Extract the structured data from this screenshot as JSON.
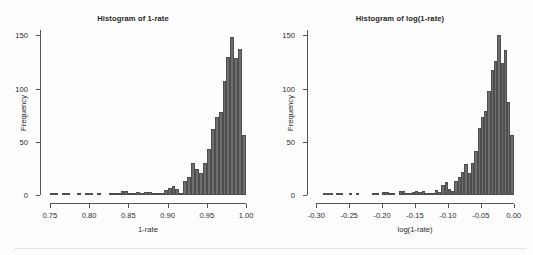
{
  "figure": {
    "background_color": "#fdfdfd",
    "bar_color": "#6e6e6e",
    "bar_edge_color": "#4e4e4e",
    "axis_color": "#555555",
    "text_color": "#2b2b2b",
    "footer_rule_color": "#e3e3e3"
  },
  "chart_data": [
    {
      "type": "bar",
      "title": "Histogram of 1-rate",
      "xlabel": "1-rate",
      "ylabel": "Frequency",
      "xlim": [
        0.745,
        1.005
      ],
      "ylim": [
        0,
        155
      ],
      "xticks": [
        0.75,
        0.8,
        0.85,
        0.9,
        0.95,
        1.0
      ],
      "xtick_labels": [
        "0.75",
        "0.80",
        "0.85",
        "0.90",
        "0.95",
        "1.00"
      ],
      "yticks": [
        0,
        50,
        100,
        150
      ],
      "ytick_labels": [
        "0",
        "50",
        "100",
        "150"
      ],
      "grid": false,
      "legend": "none",
      "bin_width": 0.005,
      "bin_starts": [
        0.75,
        0.755,
        0.76,
        0.765,
        0.77,
        0.775,
        0.78,
        0.785,
        0.79,
        0.795,
        0.8,
        0.805,
        0.81,
        0.815,
        0.82,
        0.825,
        0.83,
        0.835,
        0.84,
        0.845,
        0.85,
        0.855,
        0.86,
        0.865,
        0.87,
        0.875,
        0.88,
        0.885,
        0.89,
        0.895,
        0.9,
        0.905,
        0.91,
        0.915,
        0.92,
        0.925,
        0.93,
        0.935,
        0.94,
        0.945,
        0.95,
        0.955,
        0.96,
        0.965,
        0.97,
        0.975,
        0.98,
        0.985,
        0.99,
        0.995
      ],
      "values": [
        1,
        1,
        0,
        1,
        1,
        0,
        0,
        1,
        0,
        1,
        1,
        0,
        1,
        0,
        0,
        2,
        2,
        1,
        4,
        4,
        2,
        2,
        3,
        2,
        3,
        3,
        2,
        1,
        2,
        5,
        7,
        8,
        6,
        2,
        13,
        17,
        30,
        24,
        21,
        30,
        43,
        62,
        73,
        78,
        107,
        130,
        148,
        129,
        137,
        56
      ]
    },
    {
      "type": "bar",
      "title": "Histogram of log(1-rate)",
      "xlabel": "log(1-rate)",
      "ylabel": "Frequency",
      "xlim": [
        -0.305,
        0.005
      ],
      "ylim": [
        0,
        155
      ],
      "xticks": [
        -0.3,
        -0.25,
        -0.2,
        -0.15,
        -0.1,
        -0.05,
        0.0
      ],
      "xtick_labels": [
        "-0.30",
        "-0.25",
        "-0.20",
        "-0.15",
        "-0.10",
        "-0.05",
        "0.00"
      ],
      "yticks": [
        0,
        50,
        100,
        150
      ],
      "ytick_labels": [
        "0",
        "50",
        "100",
        "150"
      ],
      "grid": false,
      "legend": "none",
      "bin_width": 0.005,
      "bin_starts": [
        -0.29,
        -0.285,
        -0.28,
        -0.275,
        -0.27,
        -0.265,
        -0.26,
        -0.255,
        -0.25,
        -0.245,
        -0.24,
        -0.235,
        -0.23,
        -0.225,
        -0.22,
        -0.215,
        -0.21,
        -0.205,
        -0.2,
        -0.195,
        -0.19,
        -0.185,
        -0.18,
        -0.175,
        -0.17,
        -0.165,
        -0.16,
        -0.155,
        -0.15,
        -0.145,
        -0.14,
        -0.135,
        -0.13,
        -0.125,
        -0.12,
        -0.115,
        -0.11,
        -0.105,
        -0.1,
        -0.095,
        -0.09,
        -0.085,
        -0.08,
        -0.075,
        -0.07,
        -0.065,
        -0.06,
        -0.055,
        -0.05,
        -0.045,
        -0.04,
        -0.035,
        -0.03,
        -0.025,
        -0.02,
        -0.015,
        -0.01,
        -0.005
      ],
      "values": [
        1,
        1,
        1,
        0,
        1,
        1,
        0,
        0,
        1,
        0,
        1,
        0,
        0,
        0,
        0,
        1,
        1,
        0,
        3,
        3,
        1,
        1,
        0,
        4,
        4,
        2,
        1,
        3,
        4,
        3,
        4,
        2,
        1,
        2,
        5,
        3,
        9,
        12,
        6,
        4,
        13,
        17,
        22,
        29,
        21,
        30,
        41,
        63,
        73,
        79,
        98,
        117,
        126,
        150,
        124,
        136,
        87,
        56
      ]
    }
  ]
}
